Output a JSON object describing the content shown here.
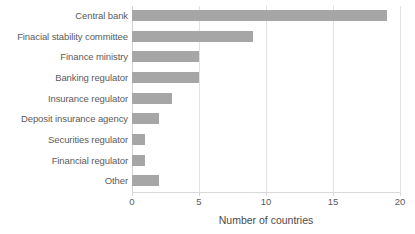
{
  "chart_data": {
    "type": "bar",
    "orientation": "horizontal",
    "title": "",
    "xlabel": "Number of countries",
    "ylabel": "",
    "xlim": [
      0,
      20
    ],
    "xticks": [
      0,
      5,
      10,
      15,
      20
    ],
    "xtick_labels": [
      "0",
      "5",
      "10",
      "15",
      "20"
    ],
    "grid": "vertical",
    "legend": "none",
    "bar_color": "#a6a6a6",
    "categories": [
      "Central bank",
      "Finacial stability committee",
      "Finance ministry",
      "Banking regulator",
      "Insurance regulator",
      "Deposit insurance agency",
      "Securities regulator",
      "Financial regulator",
      "Other"
    ],
    "values": [
      19,
      9,
      5,
      5,
      3,
      2,
      1,
      1,
      2
    ]
  },
  "axis": {
    "x_title": "Number of countries"
  },
  "colors": {
    "bar": "#a6a6a6",
    "gridline": "#e2e2e2",
    "text": "#5b5b5b",
    "background": "#ffffff"
  }
}
